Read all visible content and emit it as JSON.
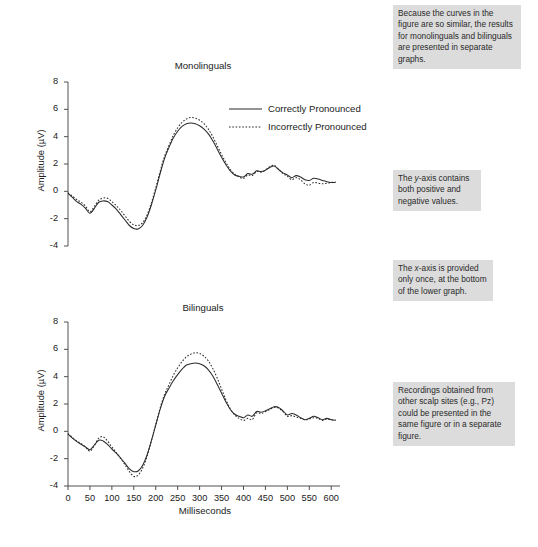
{
  "figure": {
    "background_color": "#ffffff",
    "annotation_bg_color": "#dcdcdc",
    "trace_color": "#2b2b2b",
    "axis_color": "#3c3c3c"
  },
  "annotations": [
    {
      "id": "annotation-similar-curves",
      "text": "Because the curves in the figure are so similar, the results for monolinguals and bilinguals are presented in separate graphs."
    },
    {
      "id": "annotation-y-axis",
      "text": "The y-axis contains both positive and negative values.",
      "italic_token": "y"
    },
    {
      "id": "annotation-x-axis",
      "text": "The x-axis is provided only once, at the bottom of the lower graph.",
      "italic_token": "x"
    },
    {
      "id": "annotation-scalp-sites",
      "text": "Recordings obtained from other scalp sites (e.g., Pz) could be presented in the same figure or in a separate figure."
    }
  ],
  "legend": {
    "items": [
      {
        "label": "Correctly Pronounced",
        "style": "solid"
      },
      {
        "label": "Incorrectly Pronounced",
        "style": "dotted"
      }
    ]
  },
  "chart_data": [
    {
      "type": "line",
      "id": "chart-monolinguals",
      "title": "Monolinguals",
      "xlabel": "",
      "ylabel": "Amplitude (µV)",
      "xlim": [
        0,
        620
      ],
      "ylim": [
        -4,
        8
      ],
      "yticks": [
        -4,
        -2,
        0,
        2,
        4,
        6,
        8
      ],
      "ytick_labels": [
        "-4",
        "-2",
        "0",
        "2",
        "4",
        "6",
        "8"
      ],
      "xticks": [
        0,
        50,
        100,
        150,
        200,
        250,
        300,
        350,
        400,
        450,
        500,
        550,
        600
      ],
      "xtick_labels": [],
      "grid": false,
      "x_axis_visible": false,
      "legend_position": "upper-right-inside",
      "x": [
        0,
        10,
        20,
        30,
        40,
        50,
        60,
        70,
        80,
        90,
        100,
        110,
        120,
        130,
        140,
        150,
        160,
        170,
        180,
        190,
        200,
        210,
        220,
        230,
        240,
        250,
        260,
        270,
        280,
        290,
        300,
        310,
        320,
        330,
        340,
        350,
        360,
        370,
        380,
        390,
        400,
        410,
        420,
        430,
        440,
        450,
        460,
        470,
        480,
        490,
        500,
        510,
        520,
        530,
        540,
        550,
        560,
        570,
        580,
        590,
        600,
        610
      ],
      "series": [
        {
          "name": "Correctly Pronounced",
          "style": "solid",
          "values": [
            -0.15,
            -0.45,
            -0.75,
            -0.95,
            -1.25,
            -1.6,
            -1.25,
            -0.8,
            -0.7,
            -0.75,
            -1.0,
            -1.3,
            -1.7,
            -2.1,
            -2.5,
            -2.72,
            -2.75,
            -2.5,
            -1.9,
            -1.0,
            0.1,
            1.3,
            2.4,
            3.2,
            3.9,
            4.4,
            4.75,
            4.95,
            5.0,
            4.95,
            4.8,
            4.55,
            4.2,
            3.7,
            3.1,
            2.5,
            1.95,
            1.5,
            1.2,
            1.1,
            1.05,
            1.3,
            1.25,
            1.5,
            1.45,
            1.55,
            1.75,
            1.85,
            1.6,
            1.35,
            1.2,
            1.0,
            1.15,
            1.05,
            0.85,
            0.8,
            0.95,
            0.9,
            0.8,
            0.7,
            0.65,
            0.65
          ]
        },
        {
          "name": "Incorrectly Pronounced",
          "style": "dotted",
          "values": [
            -0.1,
            -0.35,
            -0.6,
            -0.8,
            -1.1,
            -1.5,
            -1.1,
            -0.65,
            -0.5,
            -0.5,
            -0.75,
            -1.05,
            -1.4,
            -1.8,
            -2.2,
            -2.45,
            -2.5,
            -2.3,
            -1.75,
            -0.85,
            0.25,
            1.45,
            2.55,
            3.35,
            4.1,
            4.65,
            5.05,
            5.3,
            5.4,
            5.35,
            5.2,
            4.95,
            4.55,
            4.0,
            3.35,
            2.7,
            2.1,
            1.6,
            1.25,
            1.05,
            0.95,
            1.2,
            1.15,
            1.45,
            1.4,
            1.55,
            1.8,
            1.9,
            1.6,
            1.3,
            1.1,
            0.85,
            1.0,
            0.85,
            0.55,
            0.45,
            0.65,
            0.6,
            0.55,
            0.6,
            0.65,
            0.7
          ]
        }
      ]
    },
    {
      "type": "line",
      "id": "chart-bilinguals",
      "title": "Bilinguals",
      "xlabel": "Milliseconds",
      "ylabel": "Amplitude (µV)",
      "xlim": [
        0,
        620
      ],
      "ylim": [
        -4,
        8
      ],
      "yticks": [
        -4,
        -2,
        0,
        2,
        4,
        6,
        8
      ],
      "ytick_labels": [
        "-4",
        "-2",
        "0",
        "2",
        "4",
        "6",
        "8"
      ],
      "xticks": [
        0,
        50,
        100,
        150,
        200,
        250,
        300,
        350,
        400,
        450,
        500,
        550,
        600
      ],
      "xtick_labels": [
        "0",
        "50",
        "100",
        "150",
        "200",
        "250",
        "300",
        "350",
        "400",
        "450",
        "500",
        "550",
        "600"
      ],
      "grid": false,
      "x_axis_visible": true,
      "legend_position": "none",
      "x": [
        0,
        10,
        20,
        30,
        40,
        50,
        60,
        70,
        80,
        90,
        100,
        110,
        120,
        130,
        140,
        150,
        160,
        170,
        180,
        190,
        200,
        210,
        220,
        230,
        240,
        250,
        260,
        270,
        280,
        290,
        300,
        310,
        320,
        330,
        340,
        350,
        360,
        370,
        380,
        390,
        400,
        410,
        420,
        430,
        440,
        450,
        460,
        470,
        480,
        490,
        500,
        510,
        520,
        530,
        540,
        550,
        560,
        570,
        580,
        590,
        600,
        610
      ],
      "series": [
        {
          "name": "Correctly Pronounced",
          "style": "solid",
          "values": [
            -0.2,
            -0.5,
            -0.75,
            -0.95,
            -1.15,
            -1.35,
            -1.0,
            -0.65,
            -0.7,
            -0.95,
            -1.3,
            -1.6,
            -1.95,
            -2.35,
            -2.75,
            -2.95,
            -2.9,
            -2.5,
            -1.75,
            -0.7,
            0.45,
            1.6,
            2.55,
            3.15,
            3.7,
            4.15,
            4.55,
            4.85,
            4.95,
            5.0,
            4.95,
            4.8,
            4.5,
            4.05,
            3.45,
            2.8,
            2.15,
            1.6,
            1.25,
            1.1,
            1.0,
            1.2,
            1.1,
            1.45,
            1.4,
            1.5,
            1.65,
            1.8,
            1.75,
            1.5,
            1.2,
            1.3,
            1.2,
            1.0,
            0.85,
            0.95,
            1.1,
            1.0,
            0.85,
            0.95,
            0.85,
            0.8
          ]
        },
        {
          "name": "Incorrectly Pronounced",
          "style": "dotted",
          "values": [
            -0.15,
            -0.45,
            -0.7,
            -0.9,
            -1.15,
            -1.45,
            -1.05,
            -0.5,
            -0.4,
            -0.7,
            -1.15,
            -1.55,
            -2.0,
            -2.45,
            -2.95,
            -3.3,
            -3.2,
            -2.7,
            -1.85,
            -0.7,
            0.5,
            1.7,
            2.7,
            3.4,
            4.1,
            4.65,
            5.1,
            5.45,
            5.65,
            5.75,
            5.7,
            5.5,
            5.15,
            4.6,
            3.9,
            3.1,
            2.3,
            1.65,
            1.2,
            0.95,
            0.8,
            0.95,
            0.85,
            1.35,
            1.3,
            1.45,
            1.6,
            1.75,
            1.7,
            1.45,
            1.1,
            1.15,
            1.05,
            0.95,
            0.85,
            0.9,
            1.0,
            0.95,
            0.8,
            0.9,
            0.85,
            0.85
          ]
        }
      ]
    }
  ]
}
